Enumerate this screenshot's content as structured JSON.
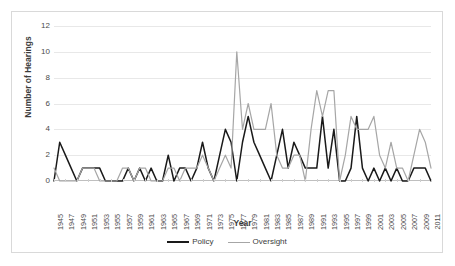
{
  "chart_data": {
    "type": "line",
    "title": "",
    "xlabel": "Year",
    "ylabel": "Number of Hearings",
    "ylim": [
      0,
      12
    ],
    "ytick_values": [
      0,
      2,
      4,
      6,
      8,
      10,
      12
    ],
    "ytick_labels": [
      "0",
      "2",
      "4",
      "6",
      "8",
      "10",
      "12"
    ],
    "grid": true,
    "legend_position": "bottom",
    "x": [
      1945,
      1946,
      1947,
      1948,
      1949,
      1950,
      1951,
      1952,
      1953,
      1954,
      1955,
      1956,
      1957,
      1958,
      1959,
      1960,
      1961,
      1962,
      1963,
      1964,
      1965,
      1966,
      1967,
      1968,
      1969,
      1970,
      1971,
      1972,
      1973,
      1974,
      1975,
      1976,
      1977,
      1978,
      1979,
      1980,
      1981,
      1982,
      1983,
      1984,
      1985,
      1986,
      1987,
      1988,
      1989,
      1990,
      1991,
      1992,
      1993,
      1994,
      1995,
      1996,
      1997,
      1998,
      1999,
      2000,
      2001,
      2002,
      2003,
      2004,
      2005,
      2006,
      2007,
      2008,
      2009,
      2010,
      2011
    ],
    "xtick_labels": [
      "1945",
      "1947",
      "1949",
      "1951",
      "1953",
      "1955",
      "1957",
      "1959",
      "1961",
      "1963",
      "1965",
      "1967",
      "1969",
      "1971",
      "1973",
      "1975",
      "1977",
      "1979",
      "1981",
      "1983",
      "1985",
      "1987",
      "1989",
      "1991",
      "1993",
      "1995",
      "1997",
      "1999",
      "2001",
      "2003",
      "2005",
      "2007",
      "2009",
      "2011"
    ],
    "series": [
      {
        "name": "Policy",
        "color": "#1a1a1a",
        "values": [
          0,
          3,
          2,
          1,
          0,
          1,
          1,
          1,
          1,
          0,
          0,
          0,
          0,
          1,
          0,
          1,
          0,
          1,
          0,
          0,
          2,
          0,
          1,
          1,
          0,
          1,
          3,
          1,
          0,
          2,
          4,
          3,
          0,
          3,
          5,
          3,
          2,
          1,
          0,
          2,
          4,
          1,
          3,
          2,
          1,
          1,
          1,
          5,
          1,
          4,
          0,
          0,
          1,
          5,
          1,
          0,
          1,
          0,
          1,
          0,
          1,
          0,
          0,
          1,
          1,
          1,
          0
        ]
      },
      {
        "name": "Oversight",
        "color": "#a6a6a6",
        "values": [
          1,
          0,
          0,
          0,
          0,
          1,
          1,
          1,
          0,
          0,
          0,
          0,
          1,
          1,
          0,
          1,
          1,
          0,
          0,
          0,
          1,
          1,
          0,
          1,
          1,
          1,
          2,
          1,
          0,
          1,
          2,
          1,
          10,
          4,
          6,
          4,
          4,
          4,
          6,
          2,
          1,
          1,
          2,
          2,
          0,
          4,
          7,
          5,
          7,
          7,
          0,
          2,
          5,
          4,
          4,
          4,
          5,
          2,
          1,
          3,
          1,
          1,
          0,
          2,
          4,
          3,
          1
        ]
      }
    ]
  },
  "legend": {
    "entries": [
      {
        "label": "Policy"
      },
      {
        "label": "Oversight"
      }
    ]
  }
}
